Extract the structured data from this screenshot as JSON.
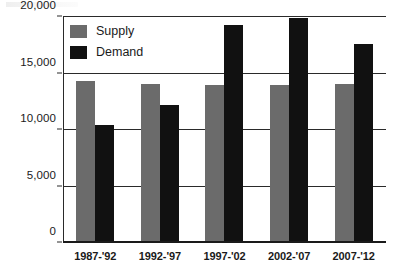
{
  "chart_data": {
    "type": "bar",
    "title": "",
    "xlabel": "",
    "ylabel": "",
    "categories": [
      "1987-'92",
      "1992-'97",
      "1997-'02",
      "2002-'07",
      "2007-'12"
    ],
    "series": [
      {
        "name": "Supply",
        "color": "#6b6b6b",
        "values": [
          14300,
          14100,
          14000,
          14000,
          14050
        ]
      },
      {
        "name": "Demand",
        "color": "#111111",
        "values": [
          10400,
          12200,
          19300,
          19900,
          17600
        ]
      }
    ],
    "ylim": [
      0,
      20000
    ],
    "yticks": [
      0,
      5000,
      10000,
      15000,
      20000
    ],
    "ytick_labels": [
      "0",
      "5,000",
      "10,000",
      "15,000",
      "20,000"
    ],
    "grid": true,
    "legend_position": "top-left"
  },
  "legend": {
    "items": [
      {
        "label": "Supply",
        "color": "#6b6b6b"
      },
      {
        "label": "Demand",
        "color": "#111111"
      }
    ]
  }
}
